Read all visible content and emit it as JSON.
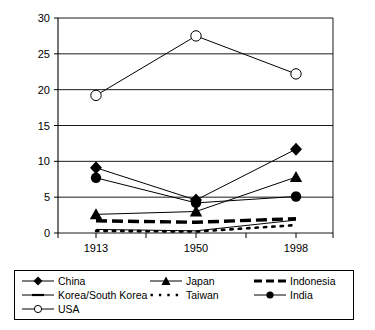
{
  "chart_data": {
    "type": "line",
    "title": "",
    "subtitle": "",
    "xlabel": "",
    "ylabel": "",
    "categories": [
      "1913",
      "1950",
      "1998"
    ],
    "x": [
      "1913",
      "1950",
      "1998"
    ],
    "ylim": [
      0,
      30
    ],
    "yticks": [
      0,
      5,
      10,
      15,
      20,
      25,
      30
    ],
    "ytick_labels": [
      "0",
      "5",
      "10",
      "15",
      "20",
      "25",
      "30"
    ],
    "grid": "horizontal",
    "legend_position": "bottom",
    "series": [
      {
        "name": "China",
        "marker": "filled-diamond",
        "line_style": "solid-thin",
        "values": [
          9.1,
          4.6,
          11.7
        ]
      },
      {
        "name": "Korea/South Korea",
        "marker": "none",
        "line_style": "solid-thin",
        "values": [
          0.5,
          0.3,
          1.8
        ]
      },
      {
        "name": "USA",
        "marker": "open-circle",
        "line_style": "solid-thin",
        "values": [
          19.2,
          27.5,
          22.2
        ]
      },
      {
        "name": "Japan",
        "marker": "filled-triangle",
        "line_style": "solid-thin",
        "values": [
          2.6,
          3.0,
          7.8
        ]
      },
      {
        "name": "Taiwan",
        "marker": "none",
        "line_style": "dotted",
        "values": [
          0.3,
          0.2,
          1.1
        ]
      },
      {
        "name": "Indonesia",
        "marker": "none",
        "line_style": "thick-dashed",
        "values": [
          1.7,
          1.5,
          2.0
        ]
      },
      {
        "name": "India",
        "marker": "filled-circle",
        "line_style": "solid-thin",
        "values": [
          7.7,
          4.2,
          5.1
        ]
      }
    ]
  },
  "axis": {
    "y_tick_labels": [
      "30",
      "25",
      "20",
      "15",
      "10",
      "5",
      "0"
    ],
    "x_tick_labels": [
      "1913",
      "1950",
      "1998"
    ]
  },
  "legend": {
    "entries": [
      {
        "label": "China",
        "key": "filled-diamond-line"
      },
      {
        "label": "Japan",
        "key": "filled-triangle-line"
      },
      {
        "label": "Indonesia",
        "key": "thick-dashed-line"
      },
      {
        "label": "Korea/South Korea",
        "key": "solid-thin-line"
      },
      {
        "label": "Taiwan",
        "key": "dotted-line"
      },
      {
        "label": "India",
        "key": "filled-circle-line"
      },
      {
        "label": "USA",
        "key": "open-circle-line"
      }
    ]
  },
  "colors": {
    "line": "#000000",
    "grid": "#000000",
    "axis": "#000000",
    "background": "#ffffff",
    "marker_fill": "#000000",
    "marker_open_fill": "#ffffff"
  }
}
